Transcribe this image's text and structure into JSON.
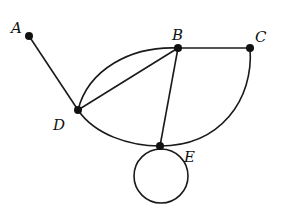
{
  "graph": {
    "nodes": [
      {
        "id": "A",
        "label": "A",
        "x": 29,
        "y": 36,
        "lx": 11,
        "ly": 32
      },
      {
        "id": "B",
        "label": "B",
        "x": 178,
        "y": 48,
        "lx": 173,
        "ly": 39
      },
      {
        "id": "C",
        "label": "C",
        "x": 250,
        "y": 48,
        "lx": 255,
        "ly": 42
      },
      {
        "id": "D",
        "label": "D",
        "x": 78,
        "y": 110,
        "lx": 54,
        "ly": 130
      },
      {
        "id": "E",
        "label": "E",
        "x": 160,
        "y": 146,
        "lx": 184,
        "ly": 161
      }
    ],
    "edges": [
      {
        "from": "A",
        "to": "D",
        "type": "straight"
      },
      {
        "from": "B",
        "to": "C",
        "type": "straight"
      },
      {
        "from": "D",
        "to": "B",
        "type": "straight"
      },
      {
        "from": "D",
        "to": "B",
        "type": "curved"
      },
      {
        "from": "B",
        "to": "E",
        "type": "straight"
      },
      {
        "from": "D",
        "to": "E",
        "type": "curved"
      },
      {
        "from": "C",
        "to": "E",
        "type": "curved"
      },
      {
        "from": "E",
        "to": "E",
        "type": "loop"
      }
    ]
  },
  "labels": {
    "A": "A",
    "B": "B",
    "C": "C",
    "D": "D",
    "E": "E"
  }
}
